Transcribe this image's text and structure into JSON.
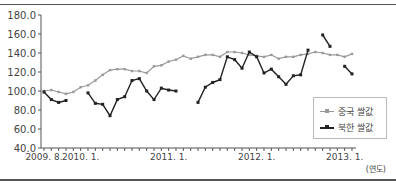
{
  "chart_data": {
    "type": "line",
    "title": "",
    "xlabel": "(연도)",
    "ylabel": "",
    "ylim": [
      40,
      180
    ],
    "yticks": [
      "180.0",
      "160.0",
      "140.0",
      "120.0",
      "100.0",
      "80.0",
      "60.0",
      "40.0"
    ],
    "xtick_labels": [
      {
        "label": "2009. 8.",
        "index": 0
      },
      {
        "label": "2010. 1.",
        "index": 5
      },
      {
        "label": "2011. 1.",
        "index": 17
      },
      {
        "label": "2012. 1.",
        "index": 29
      },
      {
        "label": "2013. 1.",
        "index": 41
      }
    ],
    "x_count": 43,
    "grid": false,
    "legend_position": "lower right",
    "series": [
      {
        "name": "중국 쌀값",
        "color": "#999999",
        "marker": "small-square",
        "values": [
          100,
          101,
          99,
          97,
          99,
          104,
          106,
          111,
          117,
          122,
          123,
          123,
          121,
          121,
          119,
          126,
          127,
          131,
          133,
          137,
          134,
          136,
          138,
          138,
          136,
          141,
          141,
          140,
          138,
          137,
          136,
          138,
          134,
          136,
          136,
          138,
          139,
          141,
          140,
          138,
          138,
          136,
          139
        ]
      },
      {
        "name": "북한 쌀값",
        "color": "#222222",
        "marker": "square",
        "values": [
          99,
          91,
          88,
          90,
          null,
          null,
          98,
          87,
          86,
          74,
          91,
          94,
          111,
          113,
          100,
          91,
          103,
          101,
          100,
          null,
          null,
          88,
          104,
          109,
          112,
          136,
          133,
          124,
          141,
          136,
          119,
          123,
          115,
          107,
          116,
          117,
          143,
          null,
          159,
          147,
          null,
          126,
          118
        ]
      }
    ]
  },
  "legend": {
    "china_label": "중국 쌀값",
    "nk_label": "북한 쌀값"
  },
  "axis": {
    "unit_label": "(연도)"
  }
}
